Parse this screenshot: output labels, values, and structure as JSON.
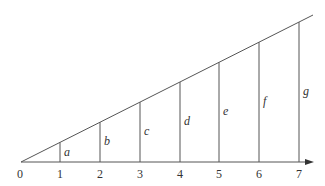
{
  "diagram": {
    "axis": {
      "tick_labels": [
        "0",
        "1",
        "2",
        "3",
        "4",
        "5",
        "6",
        "7"
      ],
      "has_arrow": true
    },
    "segments": [
      {
        "x": 1,
        "label": "a"
      },
      {
        "x": 2,
        "label": "b"
      },
      {
        "x": 3,
        "label": "c"
      },
      {
        "x": 4,
        "label": "d"
      },
      {
        "x": 5,
        "label": "e"
      },
      {
        "x": 6,
        "label": "f"
      },
      {
        "x": 7,
        "label": "g"
      }
    ],
    "colors": {
      "line": "#555555",
      "text": "#333333"
    }
  }
}
